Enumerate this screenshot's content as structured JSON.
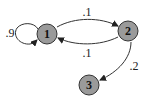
{
  "diagram": {
    "type": "markov-chain",
    "nodes": [
      {
        "id": "1",
        "label": "1",
        "cx": 47,
        "cy": 34,
        "r": 10
      },
      {
        "id": "2",
        "label": "2",
        "cx": 128,
        "cy": 31,
        "r": 10
      },
      {
        "id": "3",
        "label": "3",
        "cx": 89,
        "cy": 85,
        "r": 10
      }
    ],
    "edges": [
      {
        "from": "1",
        "to": "1",
        "label": ".9"
      },
      {
        "from": "1",
        "to": "2",
        "label": ".1"
      },
      {
        "from": "2",
        "to": "1",
        "label": ".1"
      },
      {
        "from": "2",
        "to": "3",
        "label": ".2"
      }
    ],
    "colors": {
      "node_fill": "#9a9a9a",
      "stroke": "#333333",
      "background": "#ffffff"
    }
  }
}
